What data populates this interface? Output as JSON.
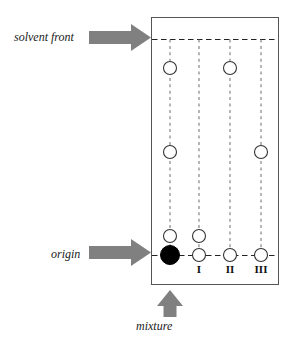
{
  "figure": {
    "type": "thin-layer-chromatography-plate-diagram",
    "plate": {
      "x": 151,
      "y": 17,
      "width": 128,
      "height": 268,
      "border_color": "#555555"
    },
    "annotations": {
      "solvent_front": "solvent front",
      "origin": "origin",
      "mixture": "mixture"
    },
    "arrow_color": "#808080",
    "arrows": [
      {
        "name": "solvent-front-arrow",
        "direction": "right",
        "x": 89,
        "y": 31,
        "length": 62,
        "thickness": 13
      },
      {
        "name": "origin-arrow",
        "direction": "right",
        "x": 89,
        "y": 246,
        "length": 62,
        "thickness": 13
      },
      {
        "name": "mixture-arrow",
        "direction": "up",
        "x": 170,
        "y": 290,
        "length": 28,
        "thickness": 13
      }
    ],
    "reference_lines": [
      {
        "name": "solvent-front-line",
        "y": 39,
        "style": "dashed",
        "color": "#222222"
      },
      {
        "name": "origin-line",
        "y": 255,
        "style": "dashed",
        "color": "#222222"
      }
    ],
    "lanes": [
      {
        "id": "lane-mixture",
        "label": "",
        "x": 170,
        "spots": [
          {
            "y": 68,
            "filled": false,
            "r": 6.5
          },
          {
            "y": 152,
            "filled": false,
            "r": 6.5
          },
          {
            "y": 236,
            "filled": false,
            "r": 6.5
          },
          {
            "y": 255,
            "filled": true,
            "r": 9.5
          }
        ]
      },
      {
        "id": "lane-I",
        "label": "I",
        "x": 199,
        "spots": [
          {
            "y": 236,
            "filled": false,
            "r": 6.5
          },
          {
            "y": 255,
            "filled": false,
            "r": 6.5
          }
        ]
      },
      {
        "id": "lane-II",
        "label": "II",
        "x": 230,
        "spots": [
          {
            "y": 68,
            "filled": false,
            "r": 6.5
          },
          {
            "y": 255,
            "filled": false,
            "r": 6.5
          }
        ]
      },
      {
        "id": "lane-III",
        "label": "III",
        "x": 261,
        "spots": [
          {
            "y": 152,
            "filled": false,
            "r": 6.5
          },
          {
            "y": 255,
            "filled": false,
            "r": 6.5
          }
        ]
      }
    ],
    "lane_label_y": 268
  }
}
